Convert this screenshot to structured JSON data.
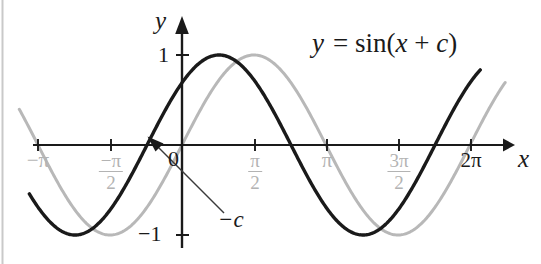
{
  "figure": {
    "background_color": "#ffffff"
  },
  "axes": {
    "y_axis_label": "y",
    "x_axis_label": "x",
    "y_ticks": [
      {
        "label": "1",
        "value": 1
      },
      {
        "label": "−1",
        "value": -1
      }
    ],
    "origin_label": "0",
    "x_ticks": [
      {
        "label": "−π",
        "value": -3.14159,
        "color": "#b3b3b3",
        "fraction": false
      },
      {
        "label": "−π/2",
        "numerator": "−π",
        "denominator": "2",
        "value": -1.5708,
        "color": "#b3b3b3",
        "fraction": true
      },
      {
        "label": "π/2",
        "numerator": "π",
        "denominator": "2",
        "value": 1.5708,
        "color": "#b3b3b3",
        "fraction": true
      },
      {
        "label": "π",
        "value": 3.14159,
        "color": "#b3b3b3",
        "fraction": false
      },
      {
        "label": "3π/2",
        "numerator": "3π",
        "denominator": "2",
        "value": 4.71239,
        "color": "#b3b3b3",
        "fraction": true
      },
      {
        "label": "2π",
        "value": 6.28319,
        "color": "#1a1a1a",
        "fraction": false
      }
    ]
  },
  "annotations": {
    "equation": "y = sin(x + c)",
    "equation_parts": {
      "y": "y",
      "equals": "=",
      "sin": "sin",
      "open": "(",
      "x": "x",
      "plus": "+",
      "c": "c",
      "close": ")"
    },
    "shift_marker": "−c",
    "shift_marker_points_to": "zero crossing of y = sin(x + c) at x = -c"
  },
  "chart_data": {
    "type": "line",
    "title": "",
    "xlabel": "x",
    "ylabel": "y",
    "xlim": [
      -3.6,
      7.0
    ],
    "ylim": [
      -1.3,
      1.3
    ],
    "grid": false,
    "legend_position": "inline-annotation",
    "x_tick_values": [
      -3.14159,
      -1.5708,
      1.5708,
      3.14159,
      4.71239,
      6.28319
    ],
    "x_tick_labels": [
      "−π",
      "−π/2",
      "π/2",
      "π",
      "3π/2",
      "2π"
    ],
    "y_tick_values": [
      -1,
      1
    ],
    "y_tick_labels": [
      "−1",
      "1"
    ],
    "phase_shift_c": 0.763,
    "series": [
      {
        "name": "y = sin(x + c)",
        "color": "#1a1a1a",
        "linewidth": 3.2,
        "formula": "sin(x + 0.763)",
        "key_points": [
          {
            "x": -0.763,
            "y": 0,
            "note": "zero crossing, labeled -c"
          },
          {
            "x": 0.808,
            "y": 1,
            "note": "maximum"
          },
          {
            "x": 2.379,
            "y": 0,
            "note": "descending zero"
          },
          {
            "x": 3.949,
            "y": -1,
            "note": "minimum"
          },
          {
            "x": 5.52,
            "y": 0,
            "note": "ascending zero"
          },
          {
            "x": -2.333,
            "y": -1,
            "note": "minimum"
          }
        ]
      },
      {
        "name": "y = sin(x)",
        "color": "#b8b8b8",
        "linewidth": 3.0,
        "formula": "sin(x)",
        "key_points": [
          {
            "x": 0,
            "y": 0,
            "note": "zero crossing"
          },
          {
            "x": 1.5708,
            "y": 1,
            "note": "maximum"
          },
          {
            "x": 3.14159,
            "y": 0,
            "note": "descending zero"
          },
          {
            "x": 4.71239,
            "y": -1,
            "note": "minimum"
          },
          {
            "x": 6.28319,
            "y": 0,
            "note": "ascending zero"
          },
          {
            "x": -1.5708,
            "y": -1,
            "note": "minimum"
          }
        ]
      }
    ]
  }
}
